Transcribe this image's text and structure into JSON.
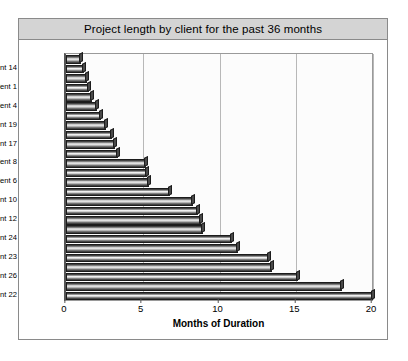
{
  "chart_data": {
    "type": "bar",
    "orientation": "horizontal",
    "title": "Project length by client for the past 36 months",
    "xlabel": "Months of Duration",
    "ylabel": "",
    "xlim": [
      0,
      20
    ],
    "xticks": [
      0,
      5,
      10,
      15,
      20
    ],
    "grid": true,
    "legend": null,
    "categories": [
      "Client 15",
      "Client 14",
      "Client 5",
      "Client 1",
      "Client 3",
      "Client 4",
      "Client 2",
      "Client 19",
      "Client 7",
      "Client 17",
      "Client 9",
      "Client 8",
      "Client 11",
      "Client 6",
      "Client 13",
      "Client 10",
      "Client 16",
      "Client 12",
      "Client 18",
      "Client 24",
      "Client 20",
      "Client 23",
      "Client 21",
      "Client 26",
      "Client 25",
      "Client 22"
    ],
    "values": [
      1.0,
      1.2,
      1.4,
      1.5,
      1.7,
      2.0,
      2.3,
      2.6,
      3.0,
      3.2,
      3.4,
      5.2,
      5.3,
      5.4,
      6.8,
      8.3,
      8.6,
      8.8,
      8.9,
      10.8,
      11.2,
      13.2,
      13.4,
      15.1,
      18.0,
      20.0
    ],
    "labeled_categories": [
      "Client 14",
      "Client 1",
      "Client 4",
      "Client 19",
      "Client 17",
      "Client 8",
      "Client 6",
      "Client 10",
      "Client 12",
      "Client 24",
      "Client 23",
      "Client 26",
      "Client 22"
    ]
  },
  "colors": {
    "title_bar": "#d4d4d4",
    "bar_dark": "#2e2e2e",
    "bar_light": "#f2f2f2",
    "frame": "#8a8a8a",
    "gridline": "#b8b8b8"
  }
}
